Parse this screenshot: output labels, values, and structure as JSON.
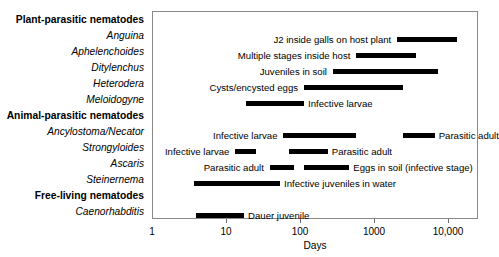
{
  "chart_data": {
    "type": "bar",
    "title": "",
    "xlabel": "Days",
    "ylabel": "",
    "scale": "log",
    "xlim": [
      1,
      20000
    ],
    "xticks": [
      1,
      10,
      100,
      1000,
      10000
    ],
    "xticklabels": [
      "1",
      "10",
      "100",
      "1000",
      "10,000"
    ],
    "grid": false,
    "legend": "none",
    "orientation": "horizontal",
    "note": "Horizontal range bars on a logarithmic time axis showing duration of nematode life-cycle stages; stage names are printed adjacent to each bar.",
    "rows": [
      {
        "label": "Plant-parasitic nematodes",
        "kind": "group",
        "segments": []
      },
      {
        "label": "Anguina",
        "kind": "genus",
        "segments": [
          {
            "stage": "J2 inside galls on host plant",
            "label_side": "left",
            "start_days": 2000,
            "end_days": 13000
          }
        ]
      },
      {
        "label": "Aphelenchoides",
        "kind": "genus",
        "segments": [
          {
            "stage": "Multiple stages inside host",
            "label_side": "left",
            "start_days": 560,
            "end_days": 3600
          }
        ]
      },
      {
        "label": "Ditylenchus",
        "kind": "genus",
        "segments": [
          {
            "stage": "Juveniles in soil",
            "label_side": "left",
            "start_days": 270,
            "end_days": 7000
          }
        ]
      },
      {
        "label": "Heterodera",
        "kind": "genus",
        "segments": [
          {
            "stage": "Cysts/encysted eggs",
            "label_side": "left",
            "start_days": 110,
            "end_days": 2400
          }
        ]
      },
      {
        "label": "Meloidogyne",
        "kind": "genus",
        "segments": [
          {
            "stage": "Infective larvae",
            "label_side": "right",
            "start_days": 18,
            "end_days": 110
          }
        ]
      },
      {
        "label": "Animal-parasitic nematodes",
        "kind": "group",
        "segments": []
      },
      {
        "label": "Ancylostoma/Necator",
        "kind": "genus",
        "segments": [
          {
            "stage": "Infective larvae",
            "label_side": "left",
            "start_days": 58,
            "end_days": 550
          },
          {
            "stage": "Parasitic adult",
            "label_side": "right",
            "start_days": 2400,
            "end_days": 6400
          }
        ]
      },
      {
        "label": "Strongyloides",
        "kind": "genus",
        "segments": [
          {
            "stage": "Infective larvae",
            "label_side": "left",
            "start_days": 13,
            "end_days": 25
          },
          {
            "stage": "Parasitic adult",
            "label_side": "right",
            "start_days": 68,
            "end_days": 230
          }
        ]
      },
      {
        "label": "Ascaris",
        "kind": "genus",
        "segments": [
          {
            "stage": "Parasitic adult",
            "label_side": "left",
            "start_days": 38,
            "end_days": 80
          },
          {
            "stage": "Eggs in soil (infective stage)",
            "label_side": "right",
            "start_days": 110,
            "end_days": 450
          }
        ]
      },
      {
        "label": "Steinernema",
        "kind": "genus",
        "segments": [
          {
            "stage": "Infective juveniles in water",
            "label_side": "right",
            "start_days": 3.6,
            "end_days": 52
          }
        ]
      },
      {
        "label": "Free-living nematodes",
        "kind": "group",
        "segments": []
      },
      {
        "label": "Caenorhabditis",
        "kind": "genus",
        "segments": [
          {
            "stage": "Dauer juvenile",
            "label_side": "right",
            "start_days": 3.8,
            "end_days": 17
          }
        ]
      }
    ]
  }
}
